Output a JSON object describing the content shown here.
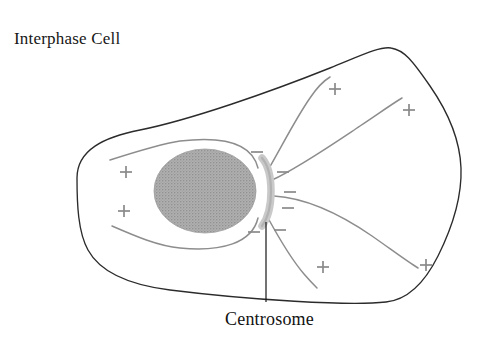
{
  "figure": {
    "title": "Interphase Cell",
    "title_position": {
      "x": 14,
      "y": 44
    },
    "callout_label": "Centrosome",
    "callout_position": {
      "x": 225,
      "y": 325
    },
    "background_color": "#ffffff"
  },
  "colors": {
    "membrane_stroke": "#2b2b2b",
    "nucleus_fill": "#a8a8a8",
    "nucleus_stipple": "#9a9a9a",
    "centrosome_fill": "#c9c9c9",
    "microtubule_stroke": "#8d8d8d",
    "sign_stroke": "#8a8a8a",
    "text_color": "#171717"
  },
  "structures": {
    "cell_membrane": {
      "name": "cell membrane",
      "path": "M 77 178 C 77 150, 104 137, 140 130 C 190 120, 270 92, 330 68 C 360 56, 380 46, 391 48 C 404 50, 412 60, 430 86 C 448 112, 460 140, 461 168 C 462 196, 452 228, 438 256 C 424 284, 406 300, 386 302 C 350 306, 250 300, 170 290 C 130 285, 100 272, 88 250 C 78 232, 77 204, 77 178 Z"
    },
    "nucleus": {
      "name": "nucleus",
      "cx": 205,
      "cy": 191,
      "rx": 51,
      "ry": 42
    },
    "centrosome": {
      "name": "centrosome",
      "arc_path": "M 262 158 C 274 172, 274 210, 262 226",
      "label": "Centrosome"
    },
    "leader_line": {
      "name": "centrosome-leader-line",
      "x1": 266,
      "y1": 222,
      "x2": 266,
      "y2": 302
    }
  },
  "microtubules": [
    {
      "id": "mt-upper-left",
      "path": "M 258 168 C 252 143, 222 136, 180 141 C 160 144, 135 152, 110 160",
      "end": "plus"
    },
    {
      "id": "mt-lower-left",
      "path": "M 258 218 C 252 243, 222 252, 180 248 C 158 246, 135 236, 112 226",
      "end": "plus"
    },
    {
      "id": "mt-up-steep",
      "path": "M 268 170 C 282 146, 296 118, 310 98 C 318 86, 325 80, 330 77",
      "end": "plus"
    },
    {
      "id": "mt-up-right",
      "path": "M 272 180 C 298 168, 330 146, 360 126 C 378 114, 392 104, 402 98",
      "end": "plus"
    },
    {
      "id": "mt-right-flat",
      "path": "M 274 196 C 306 198, 340 214, 372 236 C 392 250, 408 262, 418 268",
      "end": "plus"
    },
    {
      "id": "mt-down-right",
      "path": "M 268 218 C 280 240, 292 260, 304 274 C 310 281, 314 285, 317 288",
      "end": "plus"
    }
  ],
  "polarity_marks": {
    "minus_ends": [
      {
        "x": 257,
        "y": 152,
        "label": "-"
      },
      {
        "x": 283,
        "y": 172,
        "label": "-"
      },
      {
        "x": 290,
        "y": 192,
        "label": "-"
      },
      {
        "x": 288,
        "y": 208,
        "label": "-"
      },
      {
        "x": 254,
        "y": 232,
        "label": "-"
      },
      {
        "x": 280,
        "y": 230,
        "label": "-"
      }
    ],
    "plus_ends": [
      {
        "x": 126,
        "y": 172,
        "label": "+"
      },
      {
        "x": 124,
        "y": 211,
        "label": "+"
      },
      {
        "x": 335,
        "y": 89,
        "label": "+"
      },
      {
        "x": 409,
        "y": 110,
        "label": "+"
      },
      {
        "x": 323,
        "y": 267,
        "label": "+"
      },
      {
        "x": 426,
        "y": 265,
        "label": "+"
      }
    ]
  }
}
